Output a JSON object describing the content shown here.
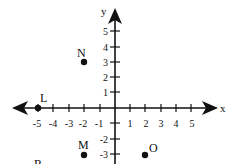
{
  "diagram": {
    "type": "coordinate-plane",
    "axes": {
      "x_label": "x",
      "y_label": "y",
      "x_ticks": [
        "-5",
        "-4",
        "-3",
        "-2",
        "-1",
        "1",
        "2",
        "3",
        "4",
        "5"
      ],
      "y_ticks": [
        "5",
        "4",
        "3",
        "2",
        "1",
        "-2",
        "-3"
      ],
      "y_tick_minus1": "-1"
    },
    "points": [
      {
        "label": "L",
        "x": -5,
        "y": 0
      },
      {
        "label": "N",
        "x": -2,
        "y": 3
      },
      {
        "label": "M",
        "x": -2,
        "y": -3
      },
      {
        "label": "O",
        "x": 2,
        "y": -3
      },
      {
        "label": "R",
        "x": -5,
        "y": -4,
        "partially_visible": true
      }
    ],
    "colors": {
      "ink": "#111111",
      "background": "#ffffff"
    }
  }
}
